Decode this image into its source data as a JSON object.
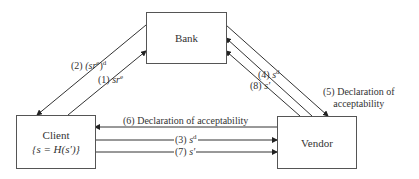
{
  "diagram": {
    "nodes": {
      "bank": {
        "label": "Bank"
      },
      "client": {
        "label": "Client",
        "sublabel": "{s = H(s′)}"
      },
      "vendor": {
        "label": "Vendor"
      }
    },
    "edges": [
      {
        "id": "1",
        "from": "Client",
        "to": "Bank",
        "num": "(1)",
        "text": "sr",
        "sup": "e"
      },
      {
        "id": "2",
        "from": "Bank",
        "to": "Client",
        "num": "(2)",
        "text": "(sr",
        "sup_inner": "e",
        "close": ")",
        "sup": "d"
      },
      {
        "id": "3",
        "from": "Client",
        "to": "Vendor",
        "num": "(3)",
        "text": "s",
        "sup": "d"
      },
      {
        "id": "4",
        "from": "Vendor",
        "to": "Bank",
        "num": "(4)",
        "text": "s",
        "sup": "d"
      },
      {
        "id": "5",
        "from": "Bank",
        "to": "Vendor",
        "line1": "(5) Declaration of",
        "line2": "acceptability"
      },
      {
        "id": "6",
        "from": "Vendor",
        "to": "Client",
        "text": "(6) Declaration of acceptability"
      },
      {
        "id": "7",
        "from": "Client",
        "to": "Vendor",
        "num": "(7)",
        "text": "s′"
      },
      {
        "id": "8",
        "from": "Vendor",
        "to": "Bank",
        "num": "(8)",
        "text": "s′"
      }
    ]
  },
  "colors": {
    "line": "#333333",
    "box_border": "#555555",
    "text": "#333333"
  }
}
